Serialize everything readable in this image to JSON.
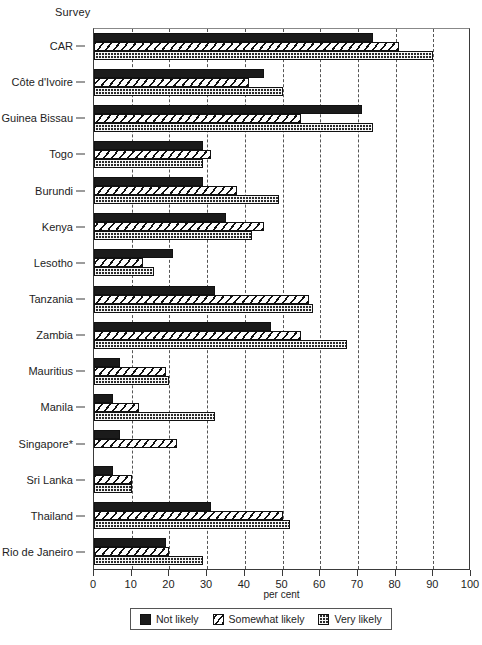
{
  "chart_data": {
    "type": "bar",
    "orientation": "horizontal",
    "title": "",
    "axis_group_title": "Survey",
    "xlabel": "per cent",
    "ylabel": "",
    "xlim": [
      0,
      100
    ],
    "xticks": [
      0,
      10,
      20,
      30,
      40,
      50,
      60,
      70,
      80,
      90,
      100
    ],
    "grid": true,
    "grid_axis": "x",
    "legend_position": "bottom-center",
    "categories": [
      "CAR",
      "Côte d'Ivoire",
      "Guinea Bissau",
      "Togo",
      "Burundi",
      "Kenya",
      "Lesotho",
      "Tanzania",
      "Zambia",
      "Mauritius",
      "Manila",
      "Singapore*",
      "Sri Lanka",
      "Thailand",
      "Rio de Janeiro"
    ],
    "series": [
      {
        "name": "Not likely",
        "pattern": "solid-black",
        "values": [
          74,
          45,
          71,
          29,
          29,
          35,
          21,
          32,
          47,
          7,
          5,
          7,
          5,
          31,
          19
        ]
      },
      {
        "name": "Somewhat likely",
        "pattern": "diagonal-hatch",
        "values": [
          81,
          41,
          55,
          31,
          38,
          45,
          13,
          57,
          55,
          19,
          12,
          22,
          10,
          50,
          20
        ]
      },
      {
        "name": "Very likely",
        "pattern": "dotted-grid",
        "values": [
          90,
          50,
          74,
          29,
          49,
          42,
          16,
          58,
          67,
          20,
          32,
          0,
          10,
          52,
          29
        ]
      }
    ]
  },
  "legend": {
    "items": [
      {
        "label": "Not likely",
        "swatch": "notlikely"
      },
      {
        "label": "Somewhat likely",
        "swatch": "somewhat"
      },
      {
        "label": "Very likely",
        "swatch": "very"
      }
    ]
  }
}
